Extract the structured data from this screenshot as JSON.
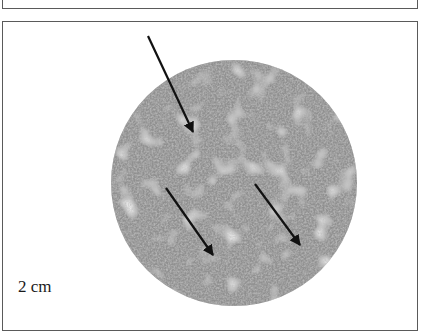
{
  "figure": {
    "panels": [
      {
        "id": "top-panel",
        "content": ""
      },
      {
        "id": "main-panel",
        "content": "circular grayscale textured specimen image with three arrows"
      }
    ],
    "specimen": {
      "shape": "circle",
      "texture": "fine speckled gray mottle with lighter patches",
      "base_color": "#9a9a9a",
      "light_patch_color": "#d4d4d4",
      "dark_speckle_color": "#555555"
    },
    "arrows": [
      {
        "from": [
          145,
          14
        ],
        "to": [
          190,
          110
        ],
        "color": "#111111"
      },
      {
        "from": [
          163,
          166
        ],
        "to": [
          210,
          233
        ],
        "color": "#111111"
      },
      {
        "from": [
          252,
          162
        ],
        "to": [
          297,
          223
        ],
        "color": "#111111"
      }
    ],
    "scale_label": "2 cm"
  }
}
